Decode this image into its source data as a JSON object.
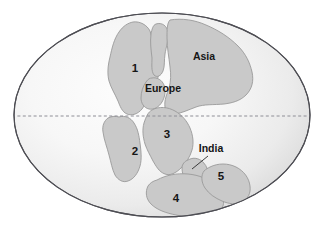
{
  "figure": {
    "projection": "oval world projection",
    "colors": {
      "landmass_fill": "#c9c9c9",
      "landmass_stroke": "#9a9a9a",
      "ocean_fill_center": "#fbfbfb",
      "ocean_fill_edge": "#dcdcdc",
      "globe_outline": "#4e4e54",
      "equator_line": "#8e8e96",
      "label_text": "#161616",
      "page_background": "#ffffff"
    }
  },
  "globe": {
    "center_x": 162,
    "center_y": 115,
    "radius_x": 148,
    "radius_y": 102
  },
  "equator": {
    "name": "equator",
    "y": 116,
    "style": "dashed"
  },
  "labels": {
    "numbered": [
      {
        "id": "1",
        "text": "1",
        "x": 135,
        "y": 72
      },
      {
        "id": "2",
        "text": "2",
        "x": 135,
        "y": 155
      },
      {
        "id": "3",
        "text": "3",
        "x": 167,
        "y": 138
      },
      {
        "id": "4",
        "text": "4",
        "x": 176,
        "y": 202
      },
      {
        "id": "5",
        "text": "5",
        "x": 221,
        "y": 180
      }
    ],
    "named": [
      {
        "id": "asia",
        "text": "Asia",
        "x": 204,
        "y": 60
      },
      {
        "id": "europe",
        "text": "Europe",
        "x": 163,
        "y": 92
      },
      {
        "id": "india",
        "text": "India",
        "x": 211,
        "y": 152
      }
    ]
  },
  "leader_line": {
    "name": "india-leader-line",
    "from_x": 208,
    "from_y": 156,
    "to_x": 192,
    "to_y": 169
  },
  "landmasses": [
    {
      "id": "landmass-1",
      "label": "1"
    },
    {
      "id": "landmass-asia",
      "label": "Asia"
    },
    {
      "id": "landmass-europe",
      "label": "Europe"
    },
    {
      "id": "landmass-2",
      "label": "2"
    },
    {
      "id": "landmass-3",
      "label": "3"
    },
    {
      "id": "landmass-india",
      "label": "India"
    },
    {
      "id": "landmass-4",
      "label": "4"
    },
    {
      "id": "landmass-5",
      "label": "5"
    }
  ]
}
